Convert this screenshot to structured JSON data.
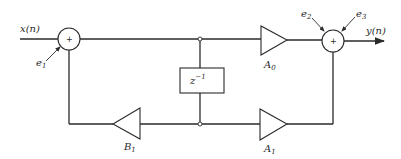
{
  "diagram": {
    "type": "block-diagram",
    "input": {
      "label": "x(n)"
    },
    "output": {
      "label": "y(n)"
    },
    "summing_nodes": [
      {
        "id": "sum1",
        "symbol": "+",
        "error_inputs": [
          "e1"
        ]
      },
      {
        "id": "sum2",
        "symbol": "+",
        "error_inputs": [
          "e2",
          "e3"
        ]
      }
    ],
    "error_labels": {
      "e1": {
        "base": "e",
        "sub": "1"
      },
      "e2": {
        "base": "e",
        "sub": "2"
      },
      "e3": {
        "base": "e",
        "sub": "3"
      }
    },
    "delay": {
      "label_base": "z",
      "label_sup": "−1"
    },
    "gains": {
      "A0": {
        "base": "A",
        "sub": "0"
      },
      "A1": {
        "base": "A",
        "sub": "1"
      },
      "B1": {
        "base": "B",
        "sub": "1"
      }
    },
    "colors": {
      "line": "#2a2a2a",
      "background": "#ffffff"
    }
  }
}
